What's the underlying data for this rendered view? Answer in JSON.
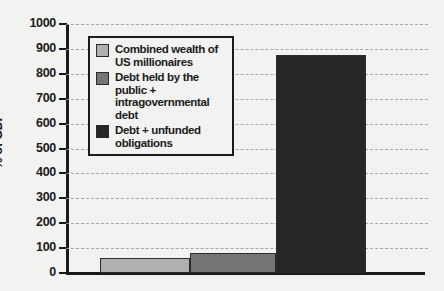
{
  "chart_data": {
    "type": "bar",
    "title": "",
    "xlabel": "",
    "ylabel": "% of GDP",
    "ylim": [
      0,
      1000
    ],
    "ytick_step": 100,
    "yticks": [
      "1000",
      "900",
      "800",
      "700",
      "600",
      "500",
      "400",
      "300",
      "200",
      "100",
      "0"
    ],
    "grid": true,
    "grid_style": "dashed-horizontal",
    "legend_position": "upper-left-inside",
    "categories": [
      "Combined wealth of US millionaires",
      "Debt held by the public + intragovernmental debt",
      "Debt + unfunded obligations"
    ],
    "values": [
      62,
      80,
      875
    ],
    "bars": [
      {
        "label": "Combined wealth of\nUS millionaires",
        "value": 62,
        "color": "#b0b0ae"
      },
      {
        "label": "Debt held by the public +\nintragovernmental debt",
        "value": 80,
        "color": "#757573"
      },
      {
        "label": "Debt + unfunded obligations",
        "value": 875,
        "color": "#262625"
      }
    ],
    "legend_entries": [
      {
        "label": "Combined wealth of\nUS millionaires",
        "color": "#b0b0ae"
      },
      {
        "label": "Debt held by the public +\nintragovernmental debt",
        "color": "#757573"
      },
      {
        "label": "Debt + unfunded obligations",
        "color": "#262625"
      }
    ],
    "colors": {
      "background": "#f2f2f0",
      "axis": "#1a1a1a",
      "gridline": "#9a9a98",
      "text": "#1a1a1a"
    }
  }
}
